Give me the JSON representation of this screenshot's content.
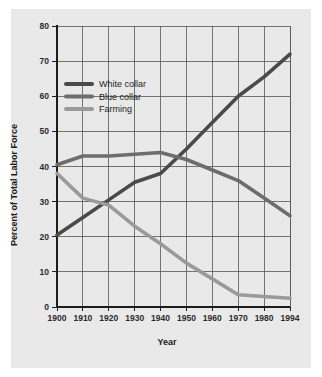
{
  "chart_data": {
    "type": "line",
    "title": "",
    "xlabel": "Year",
    "ylabel": "Percent of Total Labor Force",
    "xlim": [
      1900,
      1994
    ],
    "ylim": [
      0,
      80
    ],
    "grid": true,
    "legend_position": "upper-left-inside",
    "x_tick_labels": [
      "1900",
      "1910",
      "1920",
      "1930",
      "1940",
      "1950",
      "1960",
      "1970",
      "1980",
      "1994"
    ],
    "x_ticks": [
      1900,
      1910,
      1920,
      1930,
      1940,
      1950,
      1960,
      1970,
      1980,
      1994
    ],
    "y_tick_labels": [
      "0",
      "10",
      "20",
      "30",
      "40",
      "50",
      "60",
      "70",
      "80"
    ],
    "y_ticks": [
      0,
      10,
      20,
      30,
      40,
      50,
      60,
      70,
      80
    ],
    "x": [
      1900,
      1910,
      1920,
      1930,
      1940,
      1950,
      1960,
      1970,
      1980,
      1994
    ],
    "series": [
      {
        "name": "White collar",
        "color": "#4a4a4a",
        "values": [
          20.5,
          25.5,
          30.5,
          35.5,
          38,
          45,
          52.5,
          60,
          65.5,
          72
        ]
      },
      {
        "name": "Blue collar",
        "color": "#6d6d6d",
        "values": [
          40.5,
          43,
          43,
          43.5,
          44,
          42,
          39,
          36,
          31,
          26
        ]
      },
      {
        "name": "Farming",
        "color": "#9a9a9a",
        "values": [
          38,
          31,
          29,
          23,
          18,
          12.5,
          8,
          3.5,
          3,
          2.5
        ]
      }
    ]
  },
  "legend": {
    "items": [
      {
        "label": "White collar",
        "color": "#4a4a4a"
      },
      {
        "label": "Blue collar",
        "color": "#6d6d6d"
      },
      {
        "label": "Farming",
        "color": "#9a9a9a"
      }
    ]
  },
  "colors": {
    "plate_background": "#e9e9e9",
    "page_background": "#ffffff",
    "grid": "#555555",
    "axis": "#1c1c1c",
    "text": "#1c1c1c"
  }
}
